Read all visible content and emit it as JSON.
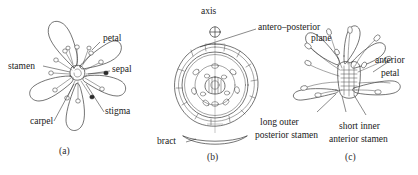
{
  "figure": {
    "background_color": "#ffffff",
    "ink_color": "#3a3a3a",
    "text_color": "#1a1a1a"
  },
  "panels": [
    {
      "caption": "(a)",
      "description": "face view of flower",
      "labels": [
        {
          "id": "stamen",
          "text": "stamen"
        },
        {
          "id": "petal",
          "text": "petal"
        },
        {
          "id": "sepal",
          "text": "sepal"
        },
        {
          "id": "stigma",
          "text": "stigma"
        },
        {
          "id": "carpel",
          "text": "carpel"
        }
      ],
      "petal_count": 5
    },
    {
      "caption": "(b)",
      "description": "floral diagram",
      "labels": [
        {
          "id": "axis",
          "text": "axis"
        },
        {
          "id": "antero-posterior-plane-line1",
          "text": "antero–posterior"
        },
        {
          "id": "antero-posterior-plane-line2",
          "text": "plane"
        },
        {
          "id": "bract",
          "text": "bract"
        }
      ],
      "axis_symbol": "⊕"
    },
    {
      "caption": "(c)",
      "description": "side view of flower",
      "labels": [
        {
          "id": "anterior-petal-line1",
          "text": "anterior"
        },
        {
          "id": "anterior-petal-line2",
          "text": "petal"
        },
        {
          "id": "long-outer-posterior-stamen-line1",
          "text": "long outer"
        },
        {
          "id": "long-outer-posterior-stamen-line2",
          "text": "posterior stamen"
        },
        {
          "id": "short-inner-anterior-stamen-line1",
          "text": "short inner"
        },
        {
          "id": "short-inner-anterior-stamen-line2",
          "text": "anterior stamen"
        }
      ]
    }
  ]
}
